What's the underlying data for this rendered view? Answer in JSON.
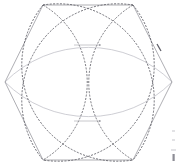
{
  "figure": {
    "title": "Hexagon with inscribed arc rosette",
    "type": "geometric-construction-diagram",
    "canvas": {
      "width": 178,
      "height": 165,
      "background": "#ffffff"
    },
    "colors": {
      "hexagon_stroke": "#8c8c94",
      "arc_dark_stroke": "#55555d",
      "arc_light_stroke": "#b9b9c1",
      "dimension_stroke": "#9a9aa2",
      "marker_stroke": "#6b6b73",
      "background": "#ffffff"
    },
    "hexagon": {
      "name": "regular-hexagon",
      "orientation": "flat-top",
      "center": {
        "x": 88,
        "y": 82
      },
      "vertices": [
        {
          "label": "V1",
          "x": 43,
          "y": 5
        },
        {
          "label": "V2",
          "x": 133,
          "y": 5
        },
        {
          "label": "V3",
          "x": 172,
          "y": 82
        },
        {
          "label": "V4",
          "x": 133,
          "y": 160
        },
        {
          "label": "V5",
          "x": 43,
          "y": 160
        },
        {
          "label": "V6",
          "x": 5,
          "y": 82
        }
      ],
      "stroke_width": 0.7
    },
    "arcs_dark": {
      "name": "dashed-petal-arcs",
      "description": "Four dark dashed circular arcs spanning opposite hexagon vertices forming a petal rosette",
      "stroke_width": 0.8,
      "dash": "2,1.4",
      "paths": [
        {
          "id": "arc-a",
          "from": "V1",
          "to": "V4",
          "rx": 96,
          "ry": 96,
          "sweep": 1
        },
        {
          "id": "arc-b",
          "from": "V2",
          "to": "V5",
          "rx": 96,
          "ry": 96,
          "sweep": 0
        },
        {
          "id": "arc-c",
          "from": "V1",
          "to": "V4",
          "rx": 96,
          "ry": 96,
          "sweep": 0
        },
        {
          "id": "arc-d",
          "from": "V2",
          "to": "V5",
          "rx": 96,
          "ry": 96,
          "sweep": 1
        }
      ]
    },
    "arcs_light": {
      "name": "light-horizontal-lens-arcs",
      "description": "Two light gray arcs spanning the left and right hexagon vertices forming a horizontal lens",
      "stroke_width": 0.7,
      "paths": [
        {
          "id": "arc-light-upper",
          "from": "V6",
          "to": "V3",
          "rx": 120,
          "ry": 120,
          "sweep": 1
        },
        {
          "id": "arc-light-lower",
          "from": "V6",
          "to": "V3",
          "rx": 120,
          "ry": 120,
          "sweep": 0
        }
      ]
    },
    "dimensions": [
      {
        "name": "upper-horizontal-dimension",
        "x1": 74,
        "x2": 101,
        "y": 45,
        "arrow": "right",
        "label": ""
      },
      {
        "name": "lower-horizontal-dimension",
        "x1": 74,
        "x2": 101,
        "y": 121,
        "arrow": "right",
        "label": ""
      }
    ],
    "markers": [
      {
        "name": "edge-tick-upper-right",
        "x": 159,
        "y": 47,
        "length": 5,
        "angle": -63
      }
    ],
    "corner_marks": {
      "name": "bottom-right-scale-marks",
      "x": 173,
      "y_start": 131,
      "count": 3,
      "spacing": 9,
      "length": 3
    }
  }
}
